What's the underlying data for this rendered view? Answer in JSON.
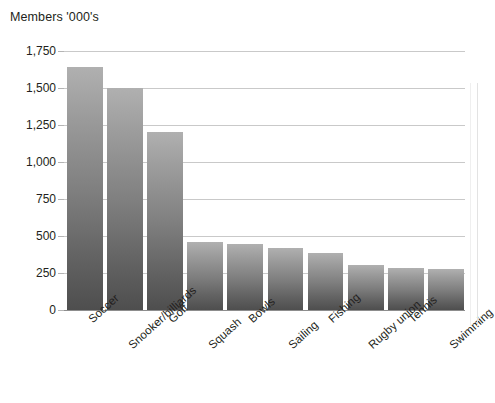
{
  "chart_data": {
    "type": "bar",
    "title": "Members '000's",
    "subtitle": "",
    "xlabel": "",
    "ylabel": "Members '000's",
    "ylim": [
      0,
      1750
    ],
    "ytick_values": [
      0,
      250,
      500,
      750,
      1000,
      1250,
      1500,
      1750
    ],
    "ytick_labels": [
      "0",
      "250",
      "500",
      "750",
      "1,000",
      "1,250",
      "1,500",
      "1,750"
    ],
    "grid": true,
    "legend": "none",
    "categories": [
      "Soccer",
      "Snooker/billiards",
      "Golf",
      "Squash",
      "Bowls",
      "Sailing",
      "Fishing",
      "Rugby union",
      "Tennis",
      "Swimming"
    ],
    "values": [
      1640,
      1500,
      1200,
      460,
      445,
      420,
      385,
      305,
      285,
      275
    ],
    "series": [
      {
        "name": "Members '000's",
        "values": [
          1640,
          1500,
          1200,
          460,
          445,
          420,
          385,
          305,
          285,
          275
        ]
      }
    ],
    "bar_color_top": "#b0b0b0",
    "bar_color_bottom": "#4e4e4e",
    "gridline_color": "#c9c9c9",
    "axis_color": "#8d8d8d",
    "text_color": "#231f20",
    "background_color": "#ffffff",
    "xtick_rotation_degrees": -42
  }
}
